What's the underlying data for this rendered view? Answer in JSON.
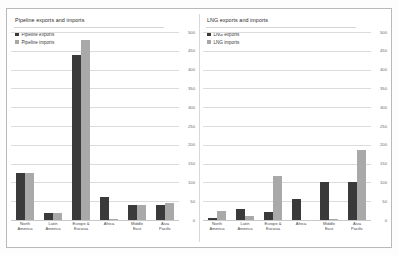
{
  "figure": {
    "background": "#ffffff",
    "frame_color": "#b9b9b9",
    "colors": {
      "exports": "#3a3a3a",
      "imports": "#a9a9a9",
      "grid": "#dcdcdc"
    }
  },
  "chart_data": [
    {
      "type": "bar",
      "title": "Pipeline exports and imports",
      "xlabel": "",
      "ylabel": "",
      "ylim": [
        0,
        500
      ],
      "yticks": [
        0,
        50,
        100,
        150,
        200,
        250,
        300,
        350,
        400,
        450,
        500
      ],
      "ytick_labels": [
        "0",
        "50",
        "100",
        "150",
        "200",
        "250",
        "300",
        "350",
        "400",
        "450",
        "500"
      ],
      "axis_position": "right",
      "grid": true,
      "legend": [
        "Pipeline exports",
        "Pipeline imports"
      ],
      "legend_position": "top-left",
      "categories": [
        "North America",
        "Latin America",
        "Europe & Eurasia",
        "Africa",
        "Middle East",
        "Asia Pacific"
      ],
      "category_lines": [
        [
          "North",
          "America"
        ],
        [
          "Latin",
          "America"
        ],
        [
          "Europe &",
          "Eurasia"
        ],
        [
          "Africa",
          ""
        ],
        [
          "Middle",
          "East"
        ],
        [
          "Asia",
          "Pacific"
        ]
      ],
      "series": [
        {
          "name": "Pipeline exports",
          "values": [
            125,
            18,
            440,
            62,
            40,
            40
          ]
        },
        {
          "name": "Pipeline imports",
          "values": [
            125,
            18,
            480,
            2,
            40,
            45
          ]
        }
      ]
    },
    {
      "type": "bar",
      "title": "LNG exports and imports",
      "xlabel": "",
      "ylabel": "",
      "ylim": [
        0,
        500
      ],
      "yticks": [
        0,
        50,
        100,
        150,
        200,
        250,
        300,
        350,
        400,
        450,
        500
      ],
      "ytick_labels": [
        "0",
        "50",
        "100",
        "150",
        "200",
        "250",
        "300",
        "350",
        "400",
        "450",
        "500"
      ],
      "axis_position": "right",
      "grid": true,
      "legend": [
        "LNG exports",
        "LNG imports"
      ],
      "legend_position": "top-left",
      "categories": [
        "North America",
        "Latin America",
        "Europe & Eurasia",
        "Africa",
        "Middle East",
        "Asia Pacific"
      ],
      "category_lines": [
        [
          "North",
          "America"
        ],
        [
          "Latin",
          "America"
        ],
        [
          "Europe &",
          "Eurasia"
        ],
        [
          "Africa",
          ""
        ],
        [
          "Middle",
          "East"
        ],
        [
          "Asia",
          "Pacific"
        ]
      ],
      "series": [
        {
          "name": "LNG exports",
          "values": [
            5,
            28,
            22,
            55,
            102,
            100
          ]
        },
        {
          "name": "LNG imports",
          "values": [
            25,
            12,
            118,
            0,
            2,
            185
          ]
        }
      ]
    }
  ]
}
